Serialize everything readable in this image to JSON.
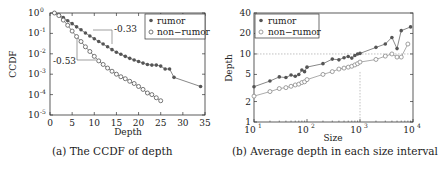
{
  "chart_data": [
    {
      "type": "line",
      "title": "",
      "caption": "(a) The CCDF of depth",
      "xlabel": "Depth",
      "ylabel": "CCDF",
      "xlim": [
        0,
        35
      ],
      "ylim": [
        1e-05,
        1
      ],
      "yscale": "log",
      "xticks": [
        "0",
        "5",
        "10",
        "15",
        "20",
        "25",
        "30",
        "35"
      ],
      "yticks": [
        "10^0",
        "10^-1",
        "10^-2",
        "10^-3",
        "10^-4",
        "10^-5"
      ],
      "grid": false,
      "legend_position": "upper right",
      "annotations": [
        "-0.33",
        "-0.53"
      ],
      "series": [
        {
          "name": "rumor",
          "marker": "filled-dot",
          "x": [
            1,
            2,
            3,
            4,
            5,
            6,
            7,
            8,
            9,
            10,
            11,
            12,
            13,
            14,
            15,
            16,
            17,
            18,
            19,
            20,
            21,
            22,
            23,
            24,
            25,
            26,
            27,
            28,
            34
          ],
          "y": [
            1.0,
            0.85,
            0.6,
            0.42,
            0.3,
            0.21,
            0.15,
            0.105,
            0.075,
            0.055,
            0.04,
            0.03,
            0.022,
            0.016,
            0.012,
            0.0095,
            0.0075,
            0.006,
            0.005,
            0.0042,
            0.0035,
            0.003,
            0.0028,
            0.0028,
            0.0025,
            0.0018,
            0.0018,
            0.0007,
            0.00025
          ]
        },
        {
          "name": "non-rumor",
          "marker": "open-circle",
          "x": [
            1,
            2,
            3,
            4,
            5,
            6,
            7,
            8,
            9,
            10,
            11,
            12,
            13,
            14,
            15,
            16,
            17,
            18,
            19,
            20,
            21,
            22,
            23,
            24,
            25
          ],
          "y": [
            1.0,
            0.75,
            0.45,
            0.25,
            0.13,
            0.07,
            0.04,
            0.022,
            0.013,
            0.0075,
            0.0045,
            0.003,
            0.002,
            0.0014,
            0.001,
            0.00075,
            0.0006,
            0.00045,
            0.00035,
            0.00025,
            0.00018,
            0.00012,
            0.0001,
            7e-05,
            5e-05
          ]
        }
      ]
    },
    {
      "type": "line",
      "title": "",
      "caption": "(b) Average depth in each size interval",
      "xlabel": "Size",
      "ylabel": "Depth",
      "xscale": "log",
      "yscale": "log",
      "xlim": [
        10,
        10000
      ],
      "ylim": [
        1,
        40
      ],
      "xticks": [
        "10^1",
        "10^2",
        "10^3",
        "10^4"
      ],
      "yticks": [
        "1",
        "2",
        "5",
        "10",
        "20",
        "40"
      ],
      "grid": false,
      "reference_lines": {
        "horizontal_y": 10,
        "vertical_x": 1000
      },
      "legend_position": "upper left",
      "series": [
        {
          "name": "rumor",
          "marker": "filled-dot",
          "x": [
            10,
            20,
            30,
            40,
            50,
            60,
            70,
            80,
            90,
            100,
            200,
            300,
            400,
            500,
            600,
            700,
            800,
            900,
            1000,
            2000,
            3000,
            4000,
            5000,
            6000,
            9000
          ],
          "y": [
            3.3,
            4.0,
            4.6,
            4.5,
            4.9,
            4.7,
            5.0,
            5.8,
            5.5,
            6.4,
            7.2,
            8.4,
            8.2,
            8.8,
            9.2,
            8.7,
            9.5,
            10.0,
            10.2,
            12.5,
            14,
            17.5,
            12,
            22,
            25
          ]
        },
        {
          "name": "non-rumor",
          "marker": "open-circle",
          "x": [
            10,
            20,
            30,
            40,
            50,
            60,
            70,
            80,
            90,
            100,
            200,
            300,
            400,
            500,
            600,
            700,
            800,
            900,
            1000,
            2000,
            3000,
            4000,
            5000,
            6000,
            8000
          ],
          "y": [
            2.4,
            2.8,
            3.1,
            3.2,
            3.35,
            3.5,
            3.6,
            3.8,
            3.9,
            4.2,
            5.0,
            5.5,
            6.0,
            6.2,
            6.4,
            6.6,
            6.9,
            7.2,
            7.6,
            8.3,
            9.3,
            10.0,
            9.0,
            9.0,
            14
          ]
        }
      ]
    }
  ],
  "left": {
    "ylabel": "CCDF",
    "xlabel": "Depth",
    "caption": "(a) The CCDF of depth",
    "legend": {
      "rumor": "rumor",
      "non_rumor": "non−rumor"
    },
    "annot_rumor": "-0.33",
    "annot_nonrumor": "-0.53",
    "xticks": [
      "0",
      "5",
      "10",
      "15",
      "20",
      "25",
      "30",
      "35"
    ],
    "ytick_base": "10",
    "ytick_exps": [
      "0",
      "-1",
      "-2",
      "-3",
      "-4",
      "-5"
    ]
  },
  "right": {
    "ylabel": "Depth",
    "xlabel": "Size",
    "caption": "(b) Average depth in each size interval",
    "legend": {
      "rumor": "rumor",
      "non_rumor": "non−rumor"
    },
    "yticks": [
      "1",
      "2",
      "5",
      "10",
      "20",
      "40"
    ],
    "xtick_base": "10",
    "xtick_exps": [
      "1",
      "2",
      "3",
      "4"
    ]
  },
  "colors": {
    "axis": "#333333",
    "series": "#555555",
    "ref_line": "#999999"
  }
}
